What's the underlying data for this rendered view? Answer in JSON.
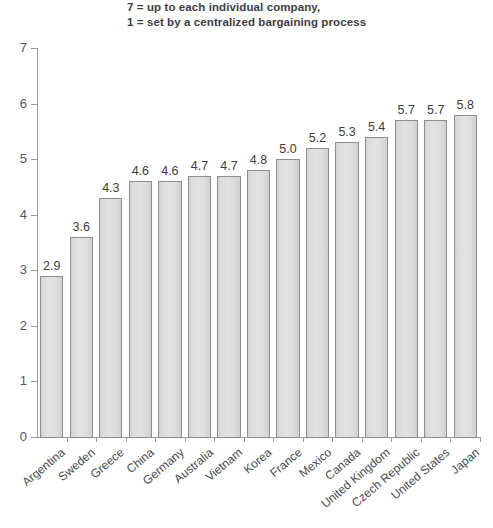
{
  "title": {
    "line1": "7 = up to each individual company,",
    "line2": "1 = set by a centralized bargaining process"
  },
  "colors": {
    "bar_fill": "#dedede",
    "bar_edge": "#8e8e92",
    "axis": "#9a9a9e",
    "title_text": "#3d3d42",
    "label_text": "#4a4a4e",
    "background": "#ffffff"
  },
  "chart_data": {
    "type": "bar",
    "title": "7 = up to each individual company, 1 = set by a centralized bargaining process",
    "subtitle": "",
    "xlabel": "",
    "ylabel": "",
    "ylim": [
      0,
      7
    ],
    "yticks": [
      0,
      1,
      2,
      3,
      4,
      5,
      6,
      7
    ],
    "ytick_labels": [
      "0",
      "1",
      "2",
      "3",
      "4",
      "5",
      "6",
      "7"
    ],
    "grid": false,
    "legend": null,
    "orientation": "vertical",
    "categories": [
      "Argentina",
      "Sweden",
      "Greece",
      "China",
      "Germany",
      "Australia",
      "Vietnam",
      "Korea",
      "France",
      "Mexico",
      "Canada",
      "United Kingdom",
      "Czech Republic",
      "United States",
      "Japan"
    ],
    "values": [
      2.9,
      3.6,
      4.3,
      4.6,
      4.6,
      4.7,
      4.7,
      4.8,
      5.0,
      5.2,
      5.3,
      5.4,
      5.7,
      5.7,
      5.8
    ],
    "value_labels": [
      "2.9",
      "3.6",
      "4.3",
      "4.6",
      "4.6",
      "4.7",
      "4.7",
      "4.8",
      "5.0",
      "5.2",
      "5.3",
      "5.4",
      "5.7",
      "5.7",
      "5.8"
    ]
  }
}
